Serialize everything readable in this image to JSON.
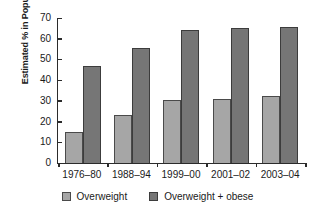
{
  "chart_data": {
    "type": "bar",
    "title": "",
    "subtitle": "",
    "xlabel": "",
    "ylabel": "Estimated % in Population",
    "categories": [
      "1976–80",
      "1988–94",
      "1999–00",
      "2001–02",
      "2003–04"
    ],
    "series": [
      {
        "name": "Overweight",
        "color": "#a6a6a6",
        "values": [
          15,
          23,
          30.5,
          31,
          32.5
        ]
      },
      {
        "name": "Overweight + obese",
        "color": "#767676",
        "values": [
          47,
          55.5,
          64,
          65,
          65.5
        ]
      }
    ],
    "ylim": [
      0,
      70
    ],
    "ytick_step": 10,
    "yticks": [
      0,
      10,
      20,
      30,
      40,
      50,
      60,
      70
    ],
    "grid": false,
    "legend_position": "bottom"
  }
}
